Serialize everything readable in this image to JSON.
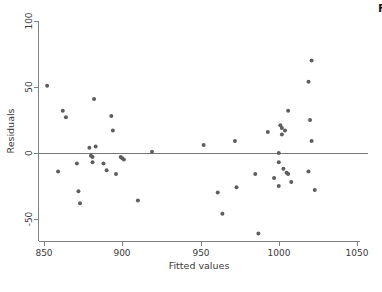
{
  "chart_data": {
    "type": "scatter",
    "title": "",
    "xlabel": "Fitted values",
    "ylabel": "Residuals",
    "xlim": [
      850,
      1055
    ],
    "ylim": [
      -65,
      103
    ],
    "xticks": [
      850,
      900,
      950,
      1000,
      1050
    ],
    "yticks": [
      -50,
      0,
      50,
      100
    ],
    "xtick_labels": [
      "850",
      "900",
      "950",
      "1000",
      "1050"
    ],
    "ytick_labels": [
      "-50",
      "0",
      "50",
      "100"
    ],
    "grid": false,
    "legend": null,
    "reference_line": {
      "orientation": "horizontal",
      "y": 0
    },
    "marker": {
      "shape": "circle",
      "color": "#5e5e5e",
      "size": 4
    },
    "points": [
      {
        "x": 852,
        "y": 51
      },
      {
        "x": 859,
        "y": -14
      },
      {
        "x": 862,
        "y": 32
      },
      {
        "x": 864,
        "y": 27
      },
      {
        "x": 871,
        "y": -8
      },
      {
        "x": 872,
        "y": -29
      },
      {
        "x": 873,
        "y": -38
      },
      {
        "x": 879,
        "y": 4
      },
      {
        "x": 880,
        "y": -2
      },
      {
        "x": 881,
        "y": -3
      },
      {
        "x": 881,
        "y": -7
      },
      {
        "x": 882,
        "y": 41
      },
      {
        "x": 883,
        "y": 5
      },
      {
        "x": 888,
        "y": -8
      },
      {
        "x": 890,
        "y": -13
      },
      {
        "x": 893,
        "y": 28
      },
      {
        "x": 894,
        "y": 17
      },
      {
        "x": 896,
        "y": -16
      },
      {
        "x": 899,
        "y": -3
      },
      {
        "x": 900,
        "y": -4
      },
      {
        "x": 901,
        "y": -5
      },
      {
        "x": 910,
        "y": -36
      },
      {
        "x": 919,
        "y": 1
      },
      {
        "x": 952,
        "y": 6
      },
      {
        "x": 961,
        "y": -30
      },
      {
        "x": 964,
        "y": -46
      },
      {
        "x": 972,
        "y": 9
      },
      {
        "x": 973,
        "y": -26
      },
      {
        "x": 985,
        "y": -16
      },
      {
        "x": 987,
        "y": -61
      },
      {
        "x": 993,
        "y": 16
      },
      {
        "x": 997,
        "y": -19
      },
      {
        "x": 1000,
        "y": 0
      },
      {
        "x": 1000,
        "y": -7
      },
      {
        "x": 1000,
        "y": -25
      },
      {
        "x": 1001,
        "y": 21
      },
      {
        "x": 1002,
        "y": 14
      },
      {
        "x": 1002,
        "y": 19
      },
      {
        "x": 1003,
        "y": -12
      },
      {
        "x": 1004,
        "y": 17
      },
      {
        "x": 1005,
        "y": -15
      },
      {
        "x": 1006,
        "y": -16
      },
      {
        "x": 1006,
        "y": 32
      },
      {
        "x": 1008,
        "y": -22
      },
      {
        "x": 1019,
        "y": 54
      },
      {
        "x": 1019,
        "y": -14
      },
      {
        "x": 1020,
        "y": 25
      },
      {
        "x": 1021,
        "y": 70
      },
      {
        "x": 1021,
        "y": 9
      },
      {
        "x": 1023,
        "y": -28
      }
    ]
  },
  "axes": {
    "x_axis_name": "fitted-values-axis",
    "y_axis_name": "residuals-axis"
  },
  "edge": {
    "clipped_glyph": "F"
  }
}
